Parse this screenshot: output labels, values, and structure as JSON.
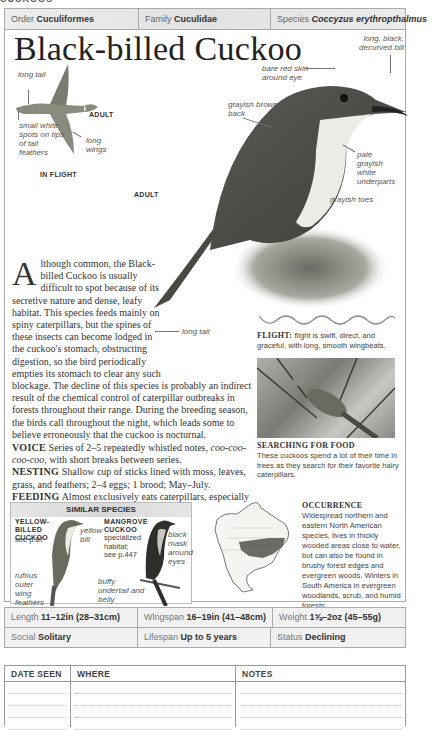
{
  "section_label": "CUCKOOS",
  "taxonomy": {
    "order_label": "Order",
    "order_value": "Cuculiformes",
    "family_label": "Family",
    "family_value": "Cuculidae",
    "species_label": "Species",
    "species_value": "Coccyzus erythropthalmus"
  },
  "title": "Black-billed Cuckoo",
  "flight_illustration": {
    "labels": {
      "long_tail": "long tail",
      "white_spots": "small white spots on tips of tail feathers",
      "long_wings": "long wings",
      "adult": "ADULT"
    },
    "caption": "IN FLIGHT"
  },
  "main_illustration": {
    "labels": {
      "bill": "long, black, decurved bill",
      "eye": "bare red skin around eye",
      "back": "grayish brown back",
      "underparts": "pale grayish white underparts",
      "toes": "grayish toes",
      "tail": "long tail",
      "adult": "ADULT"
    }
  },
  "description": {
    "drop_cap": "A",
    "intro": "lthough common, the Black-billed Cuckoo is usually difficult to spot because of its secretive nature and dense, leafy habitat. This species feeds mainly on spiny caterpillars, but the spines of these insects can become lodged in the cuckoo's stomach, obstructing digestion, so the bird periodically empties its stomach to clear any such blockage. The decline of this species is probably an indirect result of the chemical control of caterpillar outbreaks in forests throughout their range. During the breeding season, the birds call throughout the night, which leads some to believe erroneously that the cuckoo is nocturnal.",
    "voice_label": "VOICE",
    "voice_text": "Series of 2–5 repeatedly whistled notes,",
    "voice_notes": "coo-coo-coo-coo,",
    "voice_text2": "with short breaks between series.",
    "nesting_label": "NESTING",
    "nesting_text": "Shallow cup of sticks lined with moss, leaves, grass, and feathers; 2–4 eggs; 1 brood; May–July.",
    "feeding_label": "FEEDING",
    "feeding_text": "Almost exclusively eats caterpillars, especially tent caterpillars and gypsy moths."
  },
  "flight_pattern": {
    "label": "FLIGHT:",
    "text": "flight is swift, direct, and graceful, with long, smooth wingbeats."
  },
  "photo": {
    "title": "SEARCHING FOR FOOD",
    "caption": "These cuckoos spend a lot of their time in trees as they search for their favorite hairy caterpillars."
  },
  "similar_species": {
    "header": "SIMILAR SPECIES",
    "species": [
      {
        "name": "YELLOW-BILLED CUCKOO",
        "ref": "see p.87",
        "labels": [
          "yellow bill",
          "rufous outer wing feathers"
        ]
      },
      {
        "name": "MANGROVE CUCKOO",
        "ref": "specialized habitat; see p.447",
        "labels": [
          "black mask around eyes",
          "buffy undertail and belly"
        ]
      }
    ]
  },
  "occurrence": {
    "title": "OCCURRENCE",
    "text": "Widespread northern and eastern North American species, lives in thickly wooded areas close to water, but can also be found in brushy forest edges and evergreen woods. Winters in South America in evergreen woodlands, scrub, and humid forests."
  },
  "stats": {
    "length_label": "Length",
    "length_value": "11–12in (28–31cm)",
    "wingspan_label": "Wingspan",
    "wingspan_value": "16–19in (41–48cm)",
    "weight_label": "Weight",
    "weight_value": "1⅝–2oz (45–55g)",
    "social_label": "Social",
    "social_value": "Solitary",
    "lifespan_label": "Lifespan",
    "lifespan_value": "Up to 5 years",
    "status_label": "Status",
    "status_value": "Declining"
  },
  "log_table": {
    "headers": [
      "DATE SEEN",
      "WHERE",
      "NOTES"
    ]
  }
}
